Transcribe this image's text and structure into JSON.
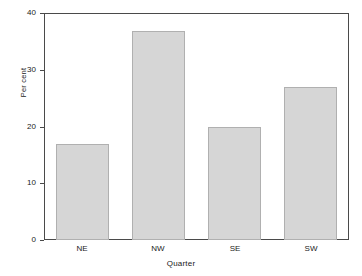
{
  "chart_data": {
    "type": "bar",
    "title": "",
    "subtitle": "",
    "categories": [
      "NE",
      "NW",
      "SE",
      "SW"
    ],
    "values": [
      16.9,
      36.8,
      19.9,
      27.0
    ],
    "series": [
      {
        "name": "Per cent",
        "values": [
          16.9,
          36.8,
          19.9,
          27.0
        ]
      }
    ],
    "xlabel": "Quarter",
    "ylabel": "Per cent",
    "ylim": [
      0,
      40
    ],
    "yticks": [
      0,
      10,
      20,
      30,
      40
    ],
    "ytick_labels": [
      "0",
      "10",
      "20",
      "30",
      "40"
    ],
    "xtick_labels": [
      "NE",
      "NW",
      "SE",
      "SW"
    ],
    "grid": false,
    "legend": false,
    "legend_position": "none",
    "annotations": [],
    "bar_fill_color": "#d6d6d6",
    "bar_border_color": "#b0b0b0",
    "axis_color": "#4a4a4a",
    "text_color": "#1a1a1a",
    "background_color": "#ffffff"
  }
}
